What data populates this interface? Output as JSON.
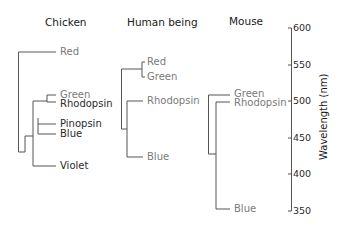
{
  "panels": {
    "chicken": {
      "title": "Chicken",
      "leaves": [
        "Red",
        "Green",
        "Rhodopsin",
        "Pinopsin",
        "Blue",
        "Violet"
      ]
    },
    "human": {
      "title": "Human being",
      "leaves": [
        "Red",
        "Green",
        "Rhodopsin",
        "Blue"
      ]
    },
    "mouse": {
      "title": "Mouse",
      "leaves": [
        "Green",
        "Rhodopsin",
        "Blue"
      ]
    }
  },
  "axis": {
    "label": "Wavelength (nm)",
    "ticks": [
      "600",
      "550",
      "500",
      "450",
      "400",
      "350"
    ]
  },
  "colors": {
    "line": "#555555",
    "label_gray": "#7a7a7a",
    "label_dark": "#2a2a2a"
  }
}
